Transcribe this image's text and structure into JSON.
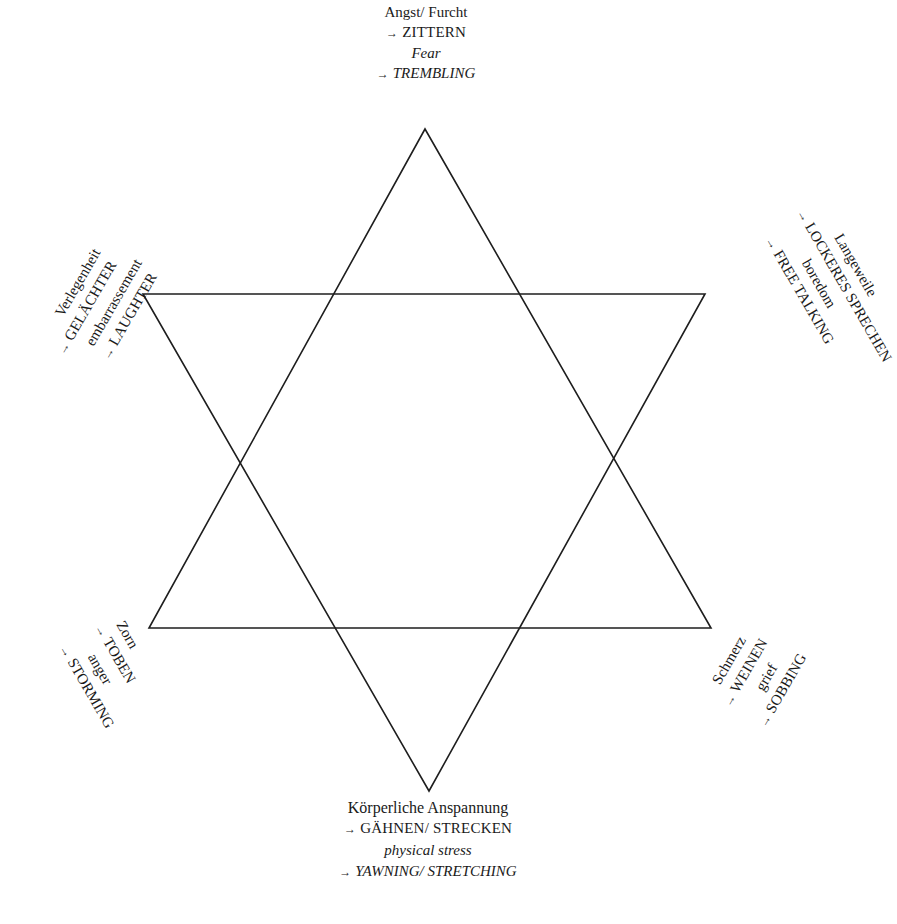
{
  "diagram": {
    "shape": "hexagram",
    "line_color": "#1e1e1e",
    "text_color": "#1a1a1a",
    "arrow_glyph": "→",
    "vertices": {
      "top": {
        "de_emotion": "Angst/ Furcht",
        "de_response": "ZITTERN",
        "en_emotion": "Fear",
        "en_response": "TREMBLING"
      },
      "upper_left": {
        "de_emotion": "Verlegenheit",
        "de_response": "GELÄCHTER",
        "en_emotion": "embarrassement",
        "en_response": "LAUGHTER"
      },
      "upper_right": {
        "de_emotion": "Langeweile",
        "de_response": "LOCKERES SPRECHEN",
        "en_emotion": "boredom",
        "en_response": "FREE TALKING"
      },
      "lower_left": {
        "de_emotion": "Zorn",
        "de_response": "TOBEN",
        "en_emotion": "anger",
        "en_response": "STORMING"
      },
      "lower_right": {
        "de_emotion": "Schmerz",
        "de_response": "WEINEN",
        "en_emotion": "grief",
        "en_response": "SOBBING"
      },
      "bottom": {
        "de_emotion": "Körperliche Anspannung",
        "de_response": "GÄHNEN/ STRECKEN",
        "en_emotion": "physical stress",
        "en_response": "YAWNING/ STRETCHING"
      }
    }
  }
}
